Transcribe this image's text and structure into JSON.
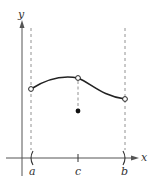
{
  "diagram": {
    "axes": {
      "x_label": "x",
      "y_label": "y",
      "color": "#555555"
    },
    "ticks": [
      {
        "label": "a",
        "x": 31,
        "shape": "left-paren"
      },
      {
        "label": "c",
        "x": 78,
        "shape": "tick"
      },
      {
        "label": "b",
        "x": 125,
        "shape": "right-paren"
      }
    ],
    "points": {
      "open_a": {
        "x": 31,
        "y": 89,
        "type": "open"
      },
      "open_c": {
        "x": 78,
        "y": 78,
        "type": "open"
      },
      "open_b": {
        "x": 125,
        "y": 99,
        "type": "open"
      },
      "filled_c": {
        "x": 78,
        "y": 111,
        "type": "filled"
      }
    },
    "colors": {
      "curve": "#222222",
      "dashed": "#777777",
      "point": "#222222"
    }
  }
}
